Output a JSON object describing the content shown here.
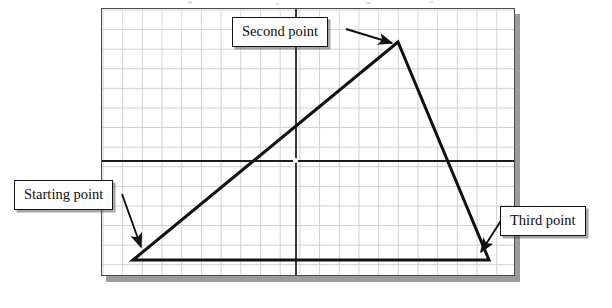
{
  "figure": {
    "type": "line-drawing",
    "background_color": "#ffffff",
    "sheet": {
      "border_color": "#4a4a4a",
      "shadow_color": "#9b9b9b",
      "grid_color": "#cfcfd4",
      "grid_spacing_px": 19.7,
      "grid_columns": 21,
      "grid_rows": 14,
      "bounds": {
        "x": 101,
        "y": 8,
        "width": 414,
        "height": 268
      }
    },
    "axes": {
      "color": "#1c1c1c",
      "horizontal_y": 159,
      "vertical_x": 194,
      "center_marker": "crosshair-origin"
    },
    "shape": {
      "name": "triangle",
      "stroke_color": "#111111",
      "stroke_width": 3,
      "fill": "none",
      "vertices": [
        {
          "label": "Starting point",
          "x": 132,
          "y": 259
        },
        {
          "label": "Second point",
          "x": 397,
          "y": 41
        },
        {
          "label": "Third point",
          "x": 488,
          "y": 259
        }
      ]
    }
  },
  "callouts": [
    {
      "id": "starting",
      "label": "Starting point",
      "box": {
        "x": 14,
        "y": 180,
        "width": 108,
        "height": 27
      },
      "arrow": {
        "from_x": 120,
        "from_y": 193,
        "to_x": 141,
        "to_y": 248
      },
      "target_vertex": "Starting point"
    },
    {
      "id": "second",
      "label": "Second point",
      "box": {
        "x": 232,
        "y": 17,
        "width": 112,
        "height": 27
      },
      "arrow": {
        "from_x": 345,
        "from_y": 29,
        "to_x": 393,
        "to_y": 44
      },
      "target_vertex": "Second point"
    },
    {
      "id": "third",
      "label": "Third point",
      "box": {
        "x": 500,
        "y": 206,
        "width": 94,
        "height": 27
      },
      "arrow": {
        "from_x": 501,
        "from_y": 219,
        "to_x": 481,
        "to_y": 253
      },
      "target_vertex": "Third point"
    }
  ],
  "colors": {
    "ink": "#111111",
    "grid": "#cfcfd4",
    "sheet_border": "#4a4a4a",
    "shadow": "#9b9b9b",
    "paper": "#ffffff"
  }
}
